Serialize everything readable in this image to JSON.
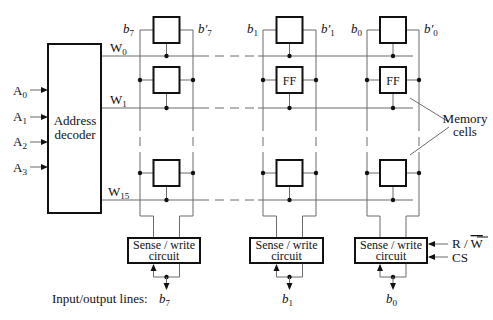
{
  "diagram": {
    "decoder": {
      "label_line1": "Address",
      "label_line2": "decoder",
      "inputs": [
        {
          "base": "A",
          "sub": "0"
        },
        {
          "base": "A",
          "sub": "1"
        },
        {
          "base": "A",
          "sub": "2"
        },
        {
          "base": "A",
          "sub": "3"
        }
      ]
    },
    "word_lines": [
      {
        "base": "W",
        "sub": "0"
      },
      {
        "base": "W",
        "sub": "1"
      },
      {
        "base": "W",
        "sub": "15"
      }
    ],
    "columns": [
      {
        "bit": {
          "base": "b",
          "sub": "7"
        },
        "bitp": {
          "base": "b",
          "prime": "′",
          "sub": "7"
        },
        "io": {
          "base": "b",
          "sub": "7"
        },
        "cells": [
          "",
          "",
          ""
        ]
      },
      {
        "bit": {
          "base": "b",
          "sub": "1"
        },
        "bitp": {
          "base": "b",
          "prime": "′",
          "sub": "1"
        },
        "io": {
          "base": "b",
          "sub": "1"
        },
        "cells": [
          "",
          "FF",
          ""
        ]
      },
      {
        "bit": {
          "base": "b",
          "sub": "0"
        },
        "bitp": {
          "base": "b",
          "prime": "′",
          "sub": "0"
        },
        "io": {
          "base": "b",
          "sub": "0"
        },
        "cells": [
          "",
          "FF",
          ""
        ]
      }
    ],
    "sense_write": {
      "line1": "Sense / write",
      "line2": "circuit"
    },
    "control": {
      "rw_r": "R / ",
      "rw_w": "W",
      "cs": "CS"
    },
    "memory_cells_label": {
      "line1": "Memory",
      "line2": "cells"
    },
    "io_label": "Input/output lines:"
  }
}
